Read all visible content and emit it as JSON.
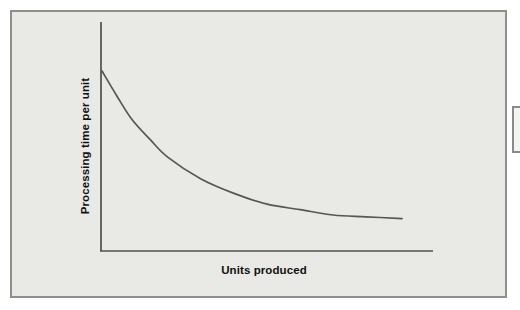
{
  "figure": {
    "y_axis_label": "Processing time per unit",
    "x_axis_label": "Units produced"
  },
  "colors": {
    "page_background": "#ffffff",
    "panel_background": "#e9e9e5",
    "panel_border": "#8f8f8c",
    "axis": "#4f4f4f",
    "curve": "#565656",
    "label_text": "#111111",
    "fragment_border": "#8a8a8a",
    "fragment_fill": "#f4f4f2"
  },
  "chart_data": {
    "type": "line",
    "title": "",
    "xlabel": "Units produced",
    "ylabel": "Processing time per unit",
    "x": [
      0,
      5,
      10,
      16,
      22,
      33,
      44,
      55,
      66,
      77,
      88,
      100
    ],
    "series": [
      {
        "name": "processing-time-per-unit",
        "values": [
          100,
          86,
          73,
          62,
          52,
          40,
          32,
          26,
          23,
          20,
          19,
          18
        ]
      }
    ],
    "x_range": [
      0,
      100
    ],
    "y_range": [
      0,
      100
    ],
    "tick_labels": "none",
    "grid": false,
    "legend": false,
    "annotation": "learning-curve: processing time decreases and flattens as units produced increase"
  }
}
